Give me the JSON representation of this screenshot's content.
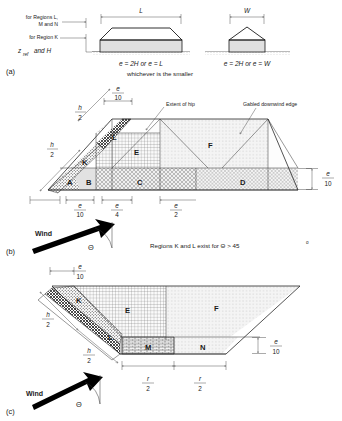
{
  "figure": {
    "title_panels": [
      "(a)",
      "(b)",
      "(c)"
    ],
    "panel_a": {
      "label": "(a)",
      "left_annotations": [
        "for Regions L,",
        "M and N",
        "for Region K"
      ],
      "axis_label_z": "z",
      "axis_label_z_sub": "ref",
      "axis_label_and_h": "and H",
      "left_building": {
        "dimension_label": "L",
        "equation": "e = 2H  or  e = L",
        "shape": "hipped-roof-profile"
      },
      "right_building": {
        "dimension_label": "W",
        "equation": "e = 2H  or  e = W",
        "shape": "gable-end-profile"
      },
      "footer_note": "whichever is the smaller"
    },
    "panel_b": {
      "label": "(b)",
      "callouts": [
        "Extent of hip",
        "Gabled downwind edge"
      ],
      "regions": [
        "A",
        "B",
        "C",
        "D",
        "E",
        "F",
        "K",
        "L"
      ],
      "top_dim": {
        "num": "e",
        "den": "10"
      },
      "right_dim": {
        "num": "e",
        "den": "10"
      },
      "diagonal_dims": [
        {
          "num": "h",
          "den": "2"
        },
        {
          "num": "h",
          "den": "2"
        }
      ],
      "bottom_dims": [
        {
          "num": "e",
          "den": "10"
        },
        {
          "num": "e",
          "den": "4"
        },
        {
          "num": "e",
          "den": "2"
        }
      ],
      "wind_label": "Wind",
      "angle_symbol": "Θ",
      "note": "Regions K and L exist for Θ > 45",
      "note_sup": "o"
    },
    "panel_c": {
      "label": "(c)",
      "regions": [
        "K",
        "L",
        "E",
        "F",
        "M",
        "N"
      ],
      "top_dim": {
        "num": "e",
        "den": "10"
      },
      "right_dim": {
        "num": "e",
        "den": "10"
      },
      "diagonal_dims": [
        {
          "num": "h",
          "den": "2"
        },
        {
          "num": "h",
          "den": "2"
        }
      ],
      "bottom_dims": [
        {
          "num": "r",
          "den": "2"
        },
        {
          "num": "r",
          "den": "2"
        }
      ],
      "wind_label": "Wind",
      "angle_symbol": "Θ"
    }
  }
}
